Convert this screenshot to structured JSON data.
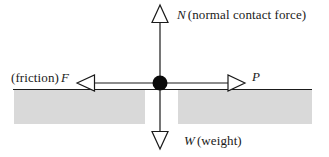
{
  "diagram": {
    "background_color": "#ffffff",
    "stroke_color": "#1a1a1a",
    "ground_fill_color": "#d9d9d9",
    "particle_color": "#000000",
    "forces": [
      {
        "id": "normal",
        "symbol": "N",
        "description": "(normal contact force)",
        "direction": "up",
        "label_position": "top-right"
      },
      {
        "id": "weight",
        "symbol": "W",
        "description": "(weight)",
        "direction": "down",
        "label_position": "bottom-right"
      },
      {
        "id": "friction",
        "symbol": "F",
        "description": "(friction)",
        "direction": "left",
        "label_position": "left"
      },
      {
        "id": "applied",
        "symbol": "P",
        "description": "",
        "direction": "right",
        "label_position": "right"
      }
    ],
    "labels": {
      "normal_prefix": "",
      "normal_symbol": "N",
      "normal_text": "(normal contact force)",
      "weight_symbol": "W",
      "weight_text": "(weight)",
      "friction_prefix": "(friction)",
      "friction_symbol": "F",
      "applied_symbol": "P"
    },
    "geometry": {
      "particle_x": 160,
      "particle_y": 83,
      "particle_radius": 7,
      "ground_line_y": 89,
      "ground_line_x_start": 13,
      "ground_line_x_end": 312,
      "ground_band_top": 90,
      "ground_band_bottom": 124,
      "ground_gap_x_start": 145,
      "ground_gap_x_end": 178,
      "normal_arrow_tip_y": 5,
      "weight_arrow_tip_y": 149,
      "friction_arrow_tip_x": 77,
      "applied_arrow_tip_x": 245
    }
  }
}
